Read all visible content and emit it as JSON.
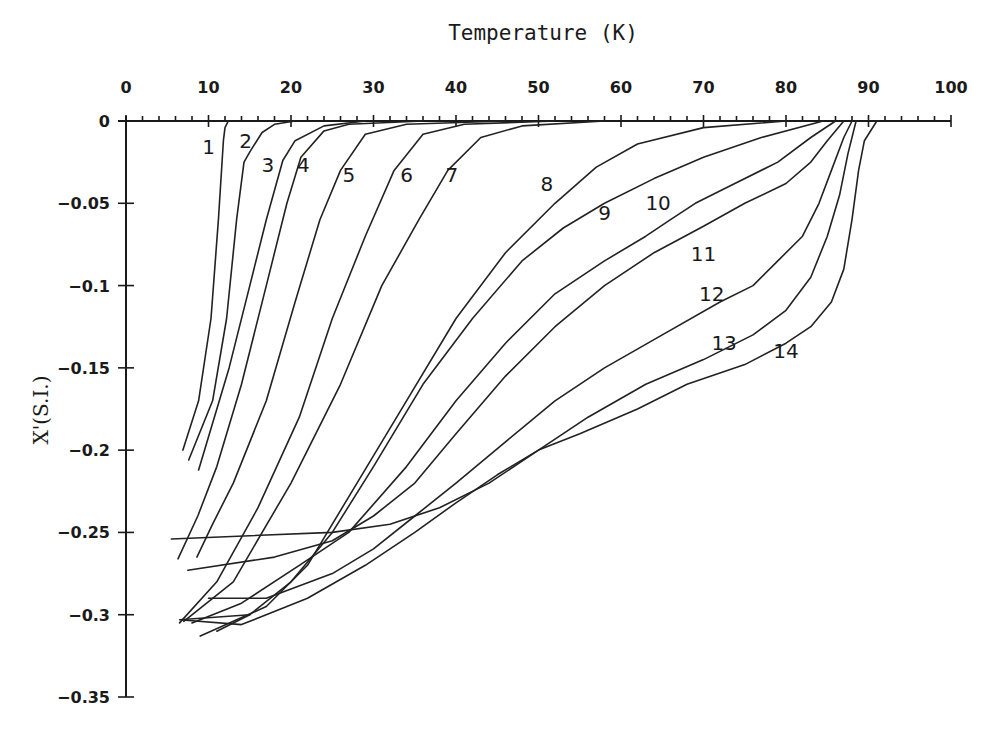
{
  "chart_data": {
    "type": "line",
    "title": "Temperature (K)",
    "xlabel": "Temperature (K)",
    "ylabel": "X'(S.I.)",
    "xlim": [
      0,
      100
    ],
    "ylim": [
      -0.35,
      0
    ],
    "x_axis_position": "top",
    "grid": false,
    "legend": "inline numeric labels 1-14",
    "x_ticks": [
      0,
      10,
      20,
      30,
      40,
      50,
      60,
      70,
      80,
      90,
      100
    ],
    "x_tick_labels": [
      "0",
      "10",
      "20",
      "30",
      "40",
      "50",
      "60",
      "70",
      "80",
      "90",
      "100"
    ],
    "y_ticks": [
      0,
      -0.05,
      -0.1,
      -0.15,
      -0.2,
      -0.25,
      -0.3,
      -0.35
    ],
    "y_tick_labels": [
      "0",
      "-0.05",
      "-0.1",
      "-0.15",
      "-0.2",
      "-0.25",
      "-0.3",
      "-0.35"
    ],
    "series": [
      {
        "name": "1",
        "label_pos": [
          10,
          -0.016
        ],
        "points": [
          [
            12.4,
            0
          ],
          [
            12.0,
            -0.004
          ],
          [
            11.8,
            -0.012
          ],
          [
            11.2,
            -0.06
          ],
          [
            10.3,
            -0.12
          ],
          [
            8.8,
            -0.17
          ],
          [
            6.9,
            -0.2
          ]
        ]
      },
      {
        "name": "2",
        "label_pos": [
          14.5,
          -0.012
        ],
        "points": [
          [
            20.5,
            0
          ],
          [
            18,
            -0.002
          ],
          [
            16.5,
            -0.007
          ],
          [
            15.1,
            -0.018
          ],
          [
            14.3,
            -0.025
          ],
          [
            13.4,
            -0.06
          ],
          [
            12.2,
            -0.12
          ],
          [
            10.5,
            -0.17
          ],
          [
            7.6,
            -0.206
          ]
        ]
      },
      {
        "name": "3",
        "label_pos": [
          17.2,
          -0.027
        ],
        "points": [
          [
            29,
            0
          ],
          [
            24,
            -0.003
          ],
          [
            20.5,
            -0.012
          ],
          [
            19,
            -0.024
          ],
          [
            17,
            -0.06
          ],
          [
            15,
            -0.1
          ],
          [
            12.5,
            -0.15
          ],
          [
            8.8,
            -0.212
          ]
        ]
      },
      {
        "name": "4",
        "label_pos": [
          21.5,
          -0.027
        ],
        "points": [
          [
            36,
            0
          ],
          [
            27,
            -0.002
          ],
          [
            24,
            -0.006
          ],
          [
            21.2,
            -0.022
          ],
          [
            19.5,
            -0.05
          ],
          [
            17,
            -0.1
          ],
          [
            14,
            -0.16
          ],
          [
            11,
            -0.21
          ],
          [
            8.7,
            -0.24
          ],
          [
            6.3,
            -0.266
          ]
        ]
      },
      {
        "name": "5",
        "label_pos": [
          27,
          -0.033
        ],
        "points": [
          [
            46,
            0
          ],
          [
            34,
            -0.002
          ],
          [
            29,
            -0.008
          ],
          [
            26,
            -0.03
          ],
          [
            23.5,
            -0.06
          ],
          [
            20.5,
            -0.11
          ],
          [
            17,
            -0.17
          ],
          [
            13,
            -0.22
          ],
          [
            10.5,
            -0.245
          ],
          [
            8.6,
            -0.265
          ]
        ]
      },
      {
        "name": "6",
        "label_pos": [
          34,
          -0.033
        ],
        "points": [
          [
            52,
            0
          ],
          [
            41,
            -0.002
          ],
          [
            36,
            -0.008
          ],
          [
            32.5,
            -0.03
          ],
          [
            29,
            -0.07
          ],
          [
            25,
            -0.12
          ],
          [
            21,
            -0.18
          ],
          [
            16,
            -0.235
          ],
          [
            11,
            -0.28
          ],
          [
            6.5,
            -0.305
          ]
        ]
      },
      {
        "name": "7",
        "label_pos": [
          39.5,
          -0.033
        ],
        "points": [
          [
            58,
            0
          ],
          [
            48,
            -0.003
          ],
          [
            43,
            -0.01
          ],
          [
            39,
            -0.03
          ],
          [
            35.5,
            -0.06
          ],
          [
            31,
            -0.1
          ],
          [
            26,
            -0.16
          ],
          [
            20,
            -0.22
          ],
          [
            13,
            -0.28
          ],
          [
            7,
            -0.304
          ]
        ]
      },
      {
        "name": "8",
        "label_pos": [
          51,
          -0.038
        ],
        "points": [
          [
            80,
            0
          ],
          [
            70,
            -0.004
          ],
          [
            62,
            -0.014
          ],
          [
            57,
            -0.028
          ],
          [
            52,
            -0.05
          ],
          [
            46,
            -0.08
          ],
          [
            40,
            -0.12
          ],
          [
            34,
            -0.17
          ],
          [
            28,
            -0.22
          ],
          [
            22,
            -0.27
          ],
          [
            17,
            -0.295
          ],
          [
            9,
            -0.313
          ]
        ]
      },
      {
        "name": "9",
        "label_pos": [
          58,
          -0.056
        ],
        "points": [
          [
            84.5,
            0
          ],
          [
            77,
            -0.01
          ],
          [
            70,
            -0.022
          ],
          [
            64,
            -0.035
          ],
          [
            58,
            -0.05
          ],
          [
            53,
            -0.065
          ],
          [
            48,
            -0.085
          ],
          [
            42,
            -0.12
          ],
          [
            36,
            -0.16
          ],
          [
            30,
            -0.21
          ],
          [
            25,
            -0.25
          ],
          [
            20,
            -0.28
          ],
          [
            15,
            -0.3
          ],
          [
            11,
            -0.31
          ]
        ]
      },
      {
        "name": "10",
        "label_pos": [
          64.5,
          -0.05
        ],
        "points": [
          [
            86,
            0
          ],
          [
            83,
            -0.01
          ],
          [
            79,
            -0.025
          ],
          [
            73,
            -0.04
          ],
          [
            69,
            -0.05
          ],
          [
            66,
            -0.06
          ],
          [
            63,
            -0.07
          ],
          [
            58,
            -0.085
          ],
          [
            52,
            -0.105
          ],
          [
            46,
            -0.135
          ],
          [
            40,
            -0.17
          ],
          [
            34,
            -0.21
          ],
          [
            27,
            -0.25
          ],
          [
            21,
            -0.27
          ],
          [
            14,
            -0.293
          ],
          [
            8,
            -0.305
          ]
        ]
      },
      {
        "name": "11",
        "label_pos": [
          70,
          -0.081
        ],
        "points": [
          [
            87,
            0
          ],
          [
            85,
            -0.012
          ],
          [
            83,
            -0.025
          ],
          [
            80,
            -0.038
          ],
          [
            75,
            -0.05
          ],
          [
            70,
            -0.064
          ],
          [
            64,
            -0.08
          ],
          [
            58,
            -0.1
          ],
          [
            52,
            -0.125
          ],
          [
            46,
            -0.155
          ],
          [
            40,
            -0.19
          ],
          [
            35,
            -0.22
          ],
          [
            30,
            -0.24
          ],
          [
            25,
            -0.255
          ],
          [
            18,
            -0.265
          ],
          [
            7.5,
            -0.273
          ]
        ]
      },
      {
        "name": "12",
        "label_pos": [
          71,
          -0.105
        ],
        "points": [
          [
            88,
            0
          ],
          [
            87,
            -0.01
          ],
          [
            85.5,
            -0.03
          ],
          [
            84,
            -0.05
          ],
          [
            82,
            -0.07
          ],
          [
            79,
            -0.085
          ],
          [
            76,
            -0.1
          ],
          [
            72,
            -0.11
          ],
          [
            65,
            -0.13
          ],
          [
            58,
            -0.15
          ],
          [
            52,
            -0.17
          ],
          [
            46,
            -0.195
          ],
          [
            40,
            -0.22
          ],
          [
            35,
            -0.24
          ],
          [
            30,
            -0.26
          ],
          [
            25,
            -0.275
          ],
          [
            17,
            -0.29
          ],
          [
            10,
            -0.29
          ]
        ]
      },
      {
        "name": "13",
        "label_pos": [
          72.5,
          -0.135
        ],
        "points": [
          [
            88.5,
            0
          ],
          [
            87.5,
            -0.02
          ],
          [
            86.5,
            -0.045
          ],
          [
            85,
            -0.07
          ],
          [
            83,
            -0.095
          ],
          [
            80,
            -0.115
          ],
          [
            76,
            -0.13
          ],
          [
            70,
            -0.145
          ],
          [
            63,
            -0.16
          ],
          [
            56,
            -0.18
          ],
          [
            50,
            -0.2
          ],
          [
            44,
            -0.22
          ],
          [
            38,
            -0.235
          ],
          [
            32,
            -0.245
          ],
          [
            25,
            -0.25
          ],
          [
            15,
            -0.252
          ],
          [
            5.5,
            -0.254
          ]
        ]
      },
      {
        "name": "14",
        "label_pos": [
          80,
          -0.14
        ],
        "points": [
          [
            91,
            0
          ],
          [
            89.5,
            -0.012
          ],
          [
            88.8,
            -0.03
          ],
          [
            88,
            -0.06
          ],
          [
            87,
            -0.09
          ],
          [
            85.5,
            -0.11
          ],
          [
            83,
            -0.125
          ],
          [
            80,
            -0.135
          ],
          [
            75,
            -0.148
          ],
          [
            68,
            -0.16
          ],
          [
            62,
            -0.175
          ],
          [
            55,
            -0.19
          ],
          [
            50,
            -0.2
          ],
          [
            45,
            -0.215
          ],
          [
            40,
            -0.232
          ],
          [
            35,
            -0.25
          ],
          [
            29,
            -0.27
          ],
          [
            22,
            -0.29
          ],
          [
            14,
            -0.306
          ],
          [
            6.5,
            -0.303
          ],
          [
            15,
            -0.3
          ]
        ]
      }
    ]
  },
  "axes": {
    "title": "Temperature (K)",
    "ylabel": "X'(S.I.)"
  }
}
